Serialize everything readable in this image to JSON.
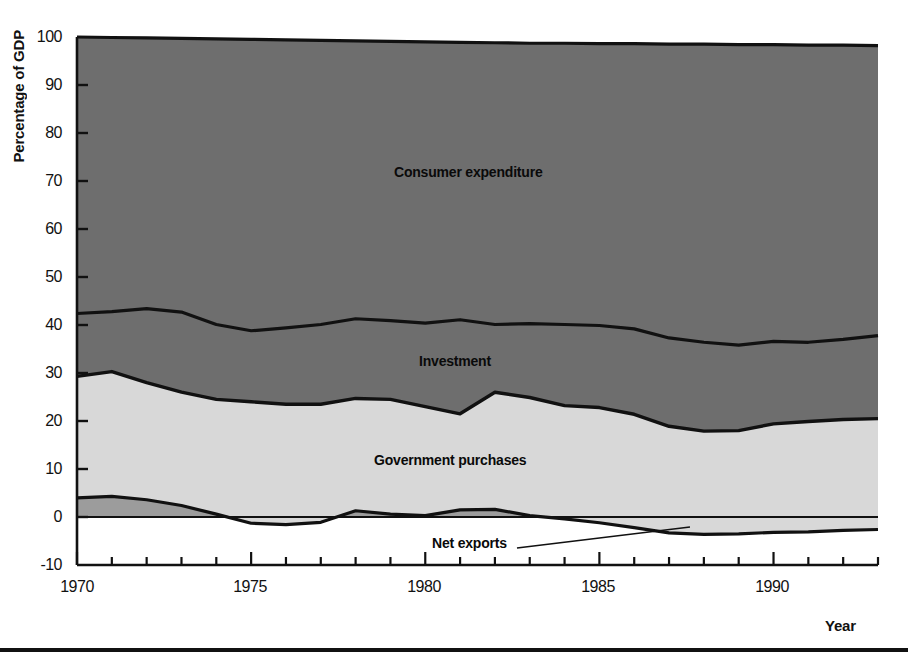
{
  "chart_data": {
    "type": "area",
    "stacked": true,
    "title": "",
    "xlabel": "Year",
    "ylabel": "Percentage of GDP",
    "xlim": [
      1970,
      1993
    ],
    "ylim": [
      -10,
      100
    ],
    "yticks": [
      -10,
      0,
      10,
      20,
      30,
      40,
      50,
      60,
      70,
      80,
      90,
      100
    ],
    "ytick_labels": [
      "-10",
      "0",
      "10",
      "20",
      "30",
      "40",
      "50",
      "60",
      "70",
      "80",
      "90",
      "100"
    ],
    "xticks": [
      1970,
      1975,
      1980,
      1985,
      1990
    ],
    "xtick_labels": [
      "1970",
      "1975",
      "1980",
      "1985",
      "1990"
    ],
    "minor_xticks_every": 1,
    "grid": false,
    "legend": "inline-area-labels",
    "x": [
      1970,
      1971,
      1972,
      1973,
      1974,
      1975,
      1976,
      1977,
      1978,
      1979,
      1980,
      1981,
      1982,
      1983,
      1984,
      1985,
      1986,
      1987,
      1988,
      1989,
      1990,
      1991,
      1992,
      1993
    ],
    "series": [
      {
        "name": "Net exports",
        "color": "#9c9c9c",
        "values": [
          4.0,
          4.3,
          3.6,
          2.4,
          0.6,
          -1.3,
          -1.6,
          -1.1,
          1.3,
          0.6,
          0.3,
          1.5,
          1.6,
          0.3,
          -0.4,
          -1.2,
          -2.2,
          -3.3,
          -3.6,
          -3.5,
          -3.2,
          -3.1,
          -2.8,
          -2.6
        ]
      },
      {
        "name": "Government purchases",
        "color": "#d8d8d8",
        "values": [
          25.3,
          26.0,
          24.4,
          23.6,
          23.9,
          25.3,
          25.1,
          24.6,
          23.4,
          23.9,
          22.7,
          20.0,
          24.4,
          24.6,
          23.6,
          24.0,
          23.6,
          22.2,
          21.5,
          21.5,
          22.6,
          23.0,
          23.1,
          23.1
        ]
      },
      {
        "name": "Investment",
        "color": "#6e6e6e",
        "values": [
          13.1,
          12.5,
          15.4,
          16.7,
          15.6,
          14.8,
          15.9,
          16.6,
          16.6,
          16.4,
          17.4,
          19.6,
          14.1,
          15.4,
          16.9,
          17.1,
          17.8,
          18.4,
          18.5,
          17.8,
          17.2,
          16.5,
          16.7,
          17.3
        ]
      },
      {
        "name": "Consumer expenditure",
        "color": "#6e6e6e",
        "values": [
          57.6,
          57.2,
          56.6,
          57.3,
          59.9,
          61.2,
          60.6,
          59.9,
          58.7,
          59.1,
          59.6,
          58.9,
          59.9,
          59.7,
          59.9,
          60.1,
          60.8,
          62.7,
          63.6,
          64.2,
          63.4,
          63.6,
          63.0,
          62.2
        ]
      }
    ],
    "boundaries": {
      "net_exports_top": [
        4.0,
        4.3,
        3.6,
        2.4,
        0.6,
        -1.3,
        -1.6,
        -1.1,
        1.3,
        0.6,
        0.3,
        1.5,
        1.6,
        0.3,
        -0.4,
        -1.2,
        -2.2,
        -3.3,
        -3.6,
        -3.5,
        -3.2,
        -3.1,
        -2.8,
        -2.6
      ],
      "government_top": [
        29.3,
        30.3,
        28.0,
        26.0,
        24.5,
        24.0,
        23.5,
        23.5,
        24.7,
        24.5,
        23.0,
        21.5,
        26.0,
        24.9,
        23.2,
        22.8,
        21.4,
        18.9,
        17.9,
        18.0,
        19.4,
        19.9,
        20.3,
        20.5
      ],
      "investment_top": [
        42.4,
        42.8,
        43.4,
        42.7,
        40.1,
        38.8,
        39.4,
        40.1,
        41.3,
        40.9,
        40.4,
        41.1,
        40.1,
        40.3,
        40.1,
        39.9,
        39.2,
        37.3,
        36.4,
        35.8,
        36.6,
        36.4,
        37.0,
        37.8
      ],
      "consumer_top": [
        100.0,
        99.9,
        99.8,
        99.7,
        99.6,
        99.5,
        99.4,
        99.3,
        99.2,
        99.1,
        99.0,
        98.9,
        98.8,
        98.7,
        98.7,
        98.6,
        98.6,
        98.5,
        98.5,
        98.4,
        98.4,
        98.3,
        98.3,
        98.2
      ]
    },
    "area_labels": [
      {
        "text": "Consumer expenditure",
        "x": 1982,
        "y": 71
      },
      {
        "text": "Investment",
        "x": 1982,
        "y": 34
      },
      {
        "text": "Government purchases",
        "x": 1981,
        "y": 13
      },
      {
        "text": "Net exports",
        "x": 1981,
        "y": -6
      }
    ],
    "colors": {
      "consumer_expenditure": "#6e6e6e",
      "investment": "#6e6e6e",
      "government_purchases": "#d8d8d8",
      "net_exports": "#9c9c9c",
      "axis": "#111111",
      "background": "#ffffff"
    }
  },
  "axes": {
    "y_title": "Percentage of GDP",
    "x_title": "Year"
  },
  "ylabels": {
    "t100": "100",
    "t90": "90",
    "t80": "80",
    "t70": "70",
    "t60": "60",
    "t50": "50",
    "t40": "40",
    "t30": "30",
    "t20": "20",
    "t10": "10",
    "t0": "0",
    "tm10": "-10"
  },
  "xlabels": {
    "x1970": "1970",
    "x1975": "1975",
    "x1980": "1980",
    "x1985": "1985",
    "x1990": "1990"
  },
  "area_labels": {
    "consumer": "Consumer expenditure",
    "investment": "Investment",
    "government": "Government purchases",
    "netexports": "Net exports"
  }
}
